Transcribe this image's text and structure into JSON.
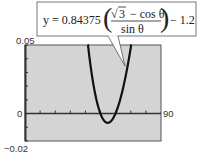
{
  "chart_data": {
    "type": "line",
    "title": "",
    "xlabel": "",
    "ylabel": "",
    "xlim": [
      0,
      90
    ],
    "ylim": [
      -0.02,
      0.05
    ],
    "x_tick_labels": {
      "max": "90"
    },
    "y_tick_labels": {
      "max": "0.05",
      "zero": "0",
      "min": "−0.02"
    },
    "x_minor_ticks": 8,
    "y_minor_ticks": 6,
    "grid": false,
    "background_color": "#d4d4d4",
    "curve_color": "#111111",
    "series": [
      {
        "name": "y = 0.84375((√3 − cos θ)/sin θ) − 1.2",
        "function": "0.84375*((sqrt(3)-cos(theta))/sin(theta))-1.2",
        "theta_unit": "degrees",
        "coefficient": 0.84375,
        "offset": -1.2,
        "sample_points": [
          {
            "x": 45,
            "y": 0.0161
          },
          {
            "x": 48,
            "y": 0.007
          },
          {
            "x": 51,
            "y": 0.0012
          },
          {
            "x": 54,
            "y": -0.0066
          },
          {
            "x": 57,
            "y": -0.0044
          },
          {
            "x": 60,
            "y": 0.0003
          },
          {
            "x": 63,
            "y": 0.0082
          },
          {
            "x": 66,
            "y": 0.019
          }
        ]
      }
    ],
    "annotation": {
      "prefix": "y = 0.84375",
      "numerator_root": "3",
      "numerator_rest": "− cos θ",
      "denominator": "sin θ",
      "suffix": "− 1.2",
      "points_to": "curve"
    }
  }
}
